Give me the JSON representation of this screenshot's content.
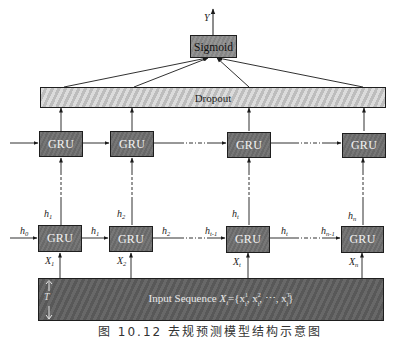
{
  "diagram": {
    "type": "GRU network architecture",
    "output": {
      "label": "Y"
    },
    "sigmoid": {
      "label": "Sigmoid"
    },
    "dropout": {
      "label": "Dropout"
    },
    "upper_layer": {
      "cells": [
        {
          "label": "GRU"
        },
        {
          "label": "GRU"
        },
        {
          "label": "GRU"
        },
        {
          "label": "GRU"
        }
      ]
    },
    "lower_layer": {
      "cells": [
        {
          "label": "GRU",
          "input": "X",
          "input_sub": "1",
          "output": "h",
          "output_sub": "1"
        },
        {
          "label": "GRU",
          "input": "X",
          "input_sub": "2",
          "output": "h",
          "output_sub": "2"
        },
        {
          "label": "GRU",
          "input": "X",
          "input_sub": "t",
          "output": "h",
          "output_sub": "t"
        },
        {
          "label": "GRU",
          "input": "X",
          "input_sub": "n",
          "output": "h",
          "output_sub": "n"
        }
      ],
      "hidden_states": [
        {
          "label": "h",
          "sub": "0"
        },
        {
          "label": "h",
          "sub": "1"
        },
        {
          "label": "h",
          "sub": "2"
        },
        {
          "label": "h",
          "sub": "t-1"
        },
        {
          "label": "h",
          "sub": "t"
        },
        {
          "label": "h",
          "sub": "n-1"
        }
      ]
    },
    "input_sequence": {
      "prefix": "Input Sequence ",
      "formula": "X",
      "formula_sub": "i",
      "formula_rest": "={x",
      "x1_sup": "1",
      "x1_sub": "i",
      "sep1": ", x",
      "x2_sup": "2",
      "x2_sub": "i",
      "sep2": ", ⋯, x",
      "xT_sup": "T",
      "xT_sub": "i",
      "close": "}"
    },
    "time_axis": {
      "label": "T"
    },
    "caption": "图 10.12   去规预测模型结构示意图"
  }
}
